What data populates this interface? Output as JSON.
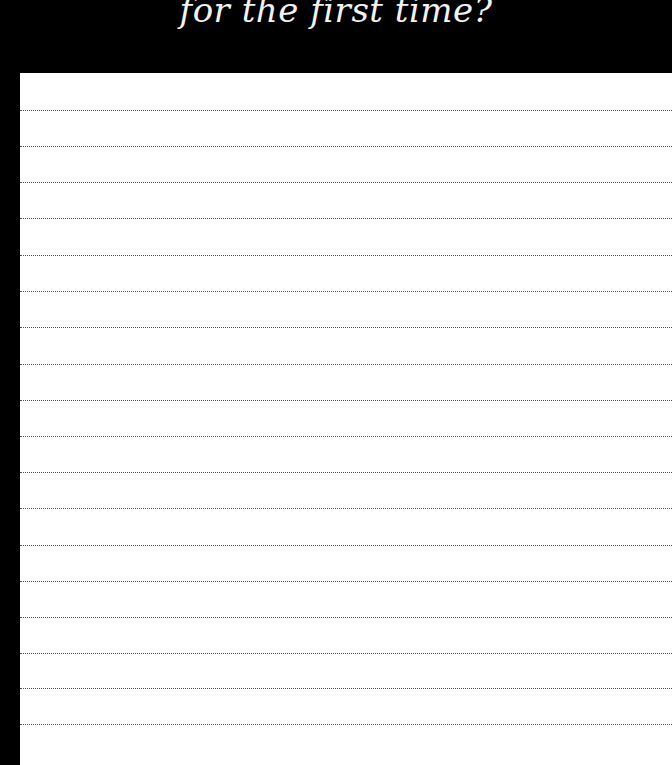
{
  "title": "for the first time?",
  "colors": {
    "background": "#000000",
    "paper": "#ffffff",
    "title_text": "#f2f2f2",
    "ruled_line": "#555555"
  },
  "paper": {
    "ruled_line_count": 18,
    "ruled_line_style": "dotted",
    "ruled_lines_y": [
      110,
      146,
      182,
      218,
      255,
      291,
      327,
      364,
      400,
      436,
      472,
      508,
      545,
      581,
      617,
      653,
      688,
      724
    ]
  }
}
